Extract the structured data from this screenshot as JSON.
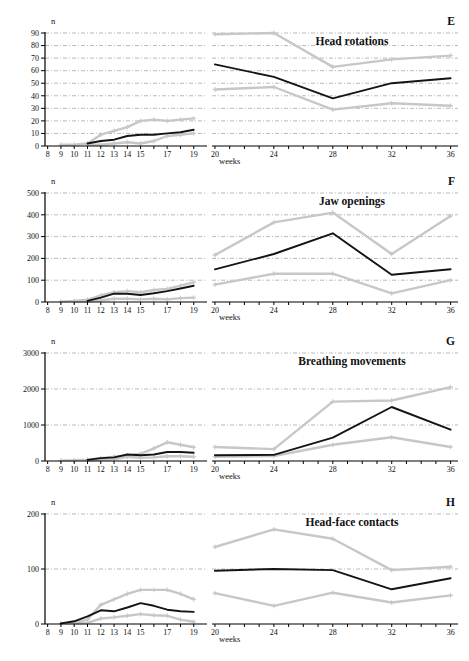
{
  "styles": {
    "median_color": "#141414",
    "range_color": "#c7c7c7",
    "grid_color": "#a8a8a8",
    "axis_color": "#000000",
    "background": "#ffffff"
  },
  "chart_data": [
    {
      "type": "line",
      "letter": "E",
      "title": "Head rotations",
      "ylabel": "n",
      "xlabel": "weeks",
      "ylim": [
        0,
        90
      ],
      "yticks": [
        0,
        10,
        20,
        30,
        40,
        50,
        60,
        70,
        80,
        90
      ],
      "legend": "black = median, gray = range",
      "left": {
        "xlim": [
          8,
          19
        ],
        "labeled_ticks": [
          8,
          9,
          10,
          11,
          12,
          13,
          14,
          15,
          17,
          19
        ],
        "series": [
          {
            "name": "upper-range",
            "color_key": "range_color",
            "x": [
              9,
              10,
              11,
              12,
              13,
              14,
              15,
              16,
              17,
              18,
              19
            ],
            "y": [
              1,
              1,
              2,
              9,
              12,
              15,
              20,
              21,
              20,
              21,
              22
            ]
          },
          {
            "name": "lower-range",
            "color_key": "range_color",
            "x": [
              11,
              12,
              13,
              14,
              15,
              16,
              17,
              18,
              19
            ],
            "y": [
              1,
              1,
              2,
              3,
              2,
              4,
              8,
              9,
              10
            ]
          },
          {
            "name": "median",
            "color_key": "median_color",
            "x": [
              11,
              12,
              13,
              14,
              15,
              16,
              17,
              18,
              19
            ],
            "y": [
              2,
              4,
              5,
              8,
              9,
              9,
              10,
              11,
              13
            ]
          }
        ]
      },
      "right": {
        "xlim": [
          20,
          36
        ],
        "labeled_ticks": [
          20,
          24,
          28,
          32,
          36
        ],
        "series": [
          {
            "name": "upper-range",
            "color_key": "range_color",
            "x": [
              20,
              24,
              28,
              32,
              36
            ],
            "y": [
              89,
              90,
              63,
              69,
              72
            ]
          },
          {
            "name": "lower-range",
            "color_key": "range_color",
            "x": [
              20,
              24,
              28,
              32,
              36
            ],
            "y": [
              45,
              47,
              29,
              34,
              32
            ]
          },
          {
            "name": "median",
            "color_key": "median_color",
            "x": [
              20,
              24,
              28,
              32,
              36
            ],
            "y": [
              65,
              55,
              38,
              50,
              54
            ]
          }
        ]
      }
    },
    {
      "type": "line",
      "letter": "F",
      "title": "Jaw openings",
      "ylabel": "n",
      "xlabel": "weeks",
      "ylim": [
        0,
        500
      ],
      "yticks": [
        0,
        100,
        200,
        300,
        400,
        500
      ],
      "legend": "black = median, gray = range",
      "left": {
        "xlim": [
          8,
          19
        ],
        "labeled_ticks": [
          8,
          9,
          10,
          11,
          12,
          13,
          14,
          15,
          17,
          19
        ],
        "series": [
          {
            "name": "upper-range",
            "color_key": "range_color",
            "x": [
              9,
              10,
              11,
              12,
              13,
              14,
              15,
              16,
              17,
              18,
              19
            ],
            "y": [
              2,
              5,
              10,
              30,
              45,
              50,
              45,
              55,
              60,
              75,
              90
            ]
          },
          {
            "name": "lower-range",
            "color_key": "range_color",
            "x": [
              10,
              11,
              12,
              13,
              14,
              15,
              16,
              17,
              18,
              19
            ],
            "y": [
              2,
              3,
              8,
              15,
              15,
              12,
              15,
              12,
              18,
              20
            ]
          },
          {
            "name": "median",
            "color_key": "median_color",
            "x": [
              11,
              12,
              13,
              14,
              15,
              16,
              17,
              18,
              19
            ],
            "y": [
              5,
              20,
              38,
              38,
              32,
              40,
              50,
              62,
              75
            ]
          }
        ]
      },
      "right": {
        "xlim": [
          20,
          36
        ],
        "labeled_ticks": [
          20,
          24,
          28,
          32,
          36
        ],
        "series": [
          {
            "name": "upper-range",
            "color_key": "range_color",
            "x": [
              20,
              24,
              28,
              32,
              36
            ],
            "y": [
              215,
              365,
              410,
              220,
              395
            ]
          },
          {
            "name": "lower-range",
            "color_key": "range_color",
            "x": [
              20,
              24,
              28,
              32,
              36
            ],
            "y": [
              80,
              130,
              130,
              40,
              100
            ]
          },
          {
            "name": "median",
            "color_key": "median_color",
            "x": [
              20,
              24,
              28,
              32,
              36
            ],
            "y": [
              150,
              220,
              315,
              125,
              150
            ]
          }
        ]
      }
    },
    {
      "type": "line",
      "letter": "G",
      "title": "Breathing movements",
      "ylabel": "n",
      "xlabel": "weeks",
      "ylim": [
        0,
        3000
      ],
      "yticks": [
        0,
        1000,
        2000,
        3000
      ],
      "legend": "black = median, gray = range",
      "left": {
        "xlim": [
          8,
          19
        ],
        "labeled_ticks": [
          8,
          9,
          10,
          11,
          12,
          13,
          14,
          15,
          17,
          19
        ],
        "series": [
          {
            "name": "upper-range",
            "color_key": "range_color",
            "x": [
              9,
              10,
              11,
              12,
              13,
              14,
              15,
              16,
              17,
              18,
              19
            ],
            "y": [
              10,
              20,
              40,
              80,
              120,
              150,
              200,
              350,
              520,
              450,
              380
            ]
          },
          {
            "name": "lower-range",
            "color_key": "range_color",
            "x": [
              11,
              12,
              13,
              14,
              15,
              16,
              17,
              18,
              19
            ],
            "y": [
              10,
              30,
              50,
              120,
              90,
              100,
              130,
              130,
              120
            ]
          },
          {
            "name": "median",
            "color_key": "median_color",
            "x": [
              11,
              12,
              13,
              14,
              15,
              16,
              17,
              18,
              19
            ],
            "y": [
              30,
              80,
              100,
              180,
              160,
              180,
              250,
              250,
              230
            ]
          }
        ]
      },
      "right": {
        "xlim": [
          20,
          36
        ],
        "labeled_ticks": [
          20,
          24,
          28,
          32,
          36
        ],
        "series": [
          {
            "name": "upper-range",
            "color_key": "range_color",
            "x": [
              20,
              24,
              28,
              32,
              36
            ],
            "y": [
              390,
              330,
              1650,
              1680,
              2050
            ]
          },
          {
            "name": "lower-range",
            "color_key": "range_color",
            "x": [
              20,
              24,
              28,
              32,
              36
            ],
            "y": [
              120,
              140,
              450,
              660,
              390
            ]
          },
          {
            "name": "median",
            "color_key": "median_color",
            "x": [
              20,
              24,
              28,
              32,
              36
            ],
            "y": [
              160,
              170,
              650,
              1500,
              870
            ]
          }
        ]
      }
    },
    {
      "type": "line",
      "letter": "H",
      "title": "Head-face contacts",
      "ylabel": "n",
      "xlabel": "weeks",
      "ylim": [
        0,
        200
      ],
      "yticks": [
        0,
        100,
        200
      ],
      "legend": "black = median, gray = range",
      "left": {
        "xlim": [
          8,
          19
        ],
        "labeled_ticks": [
          8,
          9,
          10,
          11,
          12,
          13,
          14,
          15,
          17,
          19
        ],
        "series": [
          {
            "name": "upper-range",
            "color_key": "range_color",
            "x": [
              9,
              10,
              11,
              12,
              13,
              14,
              15,
              16,
              17,
              18,
              19
            ],
            "y": [
              1,
              2,
              8,
              35,
              45,
              55,
              62,
              62,
              62,
              55,
              45
            ]
          },
          {
            "name": "lower-range",
            "color_key": "range_color",
            "x": [
              10,
              11,
              12,
              13,
              14,
              15,
              16,
              17,
              18,
              19
            ],
            "y": [
              1,
              2,
              10,
              12,
              15,
              18,
              16,
              15,
              8,
              4
            ]
          },
          {
            "name": "median",
            "color_key": "median_color",
            "x": [
              9,
              10,
              11,
              12,
              13,
              14,
              15,
              16,
              17,
              18,
              19
            ],
            "y": [
              1,
              5,
              14,
              25,
              23,
              30,
              38,
              33,
              26,
              23,
              22
            ]
          }
        ]
      },
      "right": {
        "xlim": [
          20,
          36
        ],
        "labeled_ticks": [
          20,
          24,
          28,
          32,
          36
        ],
        "series": [
          {
            "name": "upper-range",
            "color_key": "range_color",
            "x": [
              20,
              24,
              28,
              32,
              36
            ],
            "y": [
              140,
              172,
              155,
              98,
              104
            ]
          },
          {
            "name": "lower-range",
            "color_key": "range_color",
            "x": [
              20,
              24,
              28,
              32,
              36
            ],
            "y": [
              56,
              33,
              57,
              39,
              52
            ]
          },
          {
            "name": "median",
            "color_key": "median_color",
            "x": [
              20,
              24,
              28,
              32,
              36
            ],
            "y": [
              97,
              100,
              98,
              63,
              83
            ]
          }
        ]
      }
    }
  ]
}
